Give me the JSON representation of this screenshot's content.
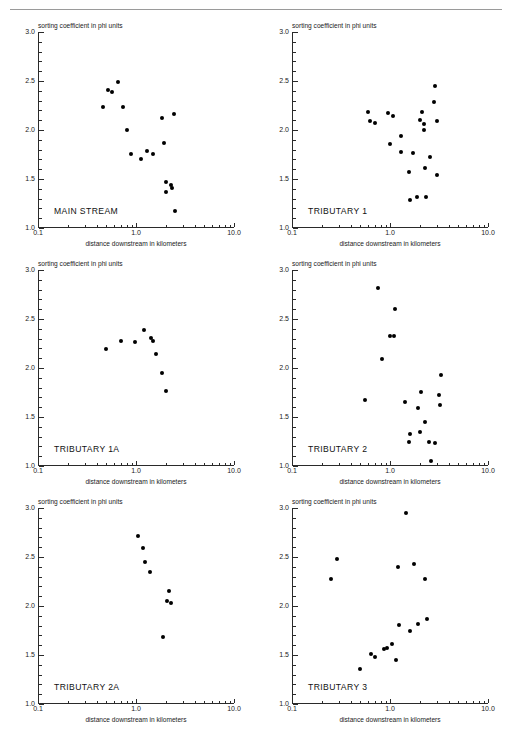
{
  "page": {
    "header_text": "",
    "has_top_rule": true
  },
  "axes": {
    "ylabel": "sorting coefficient in phi units",
    "xlabel": "distance downstream in kilometers",
    "ytick_labels": [
      "3.0",
      "2.5",
      "2.0",
      "1.5",
      "1.0"
    ],
    "ytick_values": [
      3.0,
      2.5,
      2.0,
      1.5,
      1.0
    ],
    "xtick_labels": [
      "0.1",
      "1.0",
      "10.0"
    ],
    "xtick_values": [
      0.1,
      1.0,
      10.0
    ],
    "ylim": [
      1.0,
      3.0
    ],
    "xlim": [
      0.1,
      10.0
    ],
    "xscale": "log",
    "marker_color": "#000000",
    "axis_color": "#2a2a2a"
  },
  "chart_data": [
    {
      "type": "scatter",
      "title": "MAIN STREAM",
      "xlabel": "distance downstream in kilometers",
      "ylabel": "sorting coefficient in phi units",
      "xscale": "log",
      "xlim": [
        0.1,
        10.0
      ],
      "ylim": [
        1.0,
        3.0
      ],
      "grid": false,
      "legend": "none",
      "points": [
        {
          "x": 0.46,
          "y": 2.23
        },
        {
          "x": 0.52,
          "y": 2.41
        },
        {
          "x": 0.57,
          "y": 2.39
        },
        {
          "x": 0.65,
          "y": 2.49
        },
        {
          "x": 0.74,
          "y": 2.23
        },
        {
          "x": 0.8,
          "y": 2.0
        },
        {
          "x": 0.89,
          "y": 1.76
        },
        {
          "x": 1.13,
          "y": 1.7
        },
        {
          "x": 1.3,
          "y": 1.79
        },
        {
          "x": 1.5,
          "y": 1.76
        },
        {
          "x": 1.85,
          "y": 2.12
        },
        {
          "x": 1.95,
          "y": 1.87
        },
        {
          "x": 2.0,
          "y": 1.47
        },
        {
          "x": 2.0,
          "y": 1.37
        },
        {
          "x": 2.25,
          "y": 1.44
        },
        {
          "x": 2.32,
          "y": 1.41
        },
        {
          "x": 2.45,
          "y": 2.16
        },
        {
          "x": 2.5,
          "y": 1.17
        }
      ]
    },
    {
      "type": "scatter",
      "title": "TRIBUTARY 1",
      "xlabel": "distance downstream in kilometers",
      "ylabel": "sorting coefficient in phi units",
      "xscale": "log",
      "xlim": [
        0.1,
        10.0
      ],
      "ylim": [
        1.0,
        3.0
      ],
      "grid": false,
      "legend": "none",
      "points": [
        {
          "x": 0.6,
          "y": 2.18
        },
        {
          "x": 0.63,
          "y": 2.09
        },
        {
          "x": 0.7,
          "y": 2.07
        },
        {
          "x": 0.96,
          "y": 2.17
        },
        {
          "x": 1.0,
          "y": 1.86
        },
        {
          "x": 1.07,
          "y": 2.14
        },
        {
          "x": 1.3,
          "y": 1.94
        },
        {
          "x": 1.3,
          "y": 1.78
        },
        {
          "x": 1.55,
          "y": 1.57
        },
        {
          "x": 1.6,
          "y": 1.29
        },
        {
          "x": 1.7,
          "y": 1.77
        },
        {
          "x": 1.9,
          "y": 1.32
        },
        {
          "x": 2.0,
          "y": 2.1
        },
        {
          "x": 2.1,
          "y": 2.18
        },
        {
          "x": 2.2,
          "y": 2.06
        },
        {
          "x": 2.22,
          "y": 2.0
        },
        {
          "x": 2.3,
          "y": 1.61
        },
        {
          "x": 2.35,
          "y": 1.32
        },
        {
          "x": 2.55,
          "y": 1.72
        },
        {
          "x": 2.8,
          "y": 2.29
        },
        {
          "x": 2.9,
          "y": 2.45
        },
        {
          "x": 3.0,
          "y": 2.09
        },
        {
          "x": 3.05,
          "y": 1.54
        }
      ]
    },
    {
      "type": "scatter",
      "title": "TRIBUTARY 1A",
      "xlabel": "distance downstream in kilometers",
      "ylabel": "sorting coefficient in phi units",
      "xscale": "log",
      "xlim": [
        0.1,
        10.0
      ],
      "ylim": [
        1.0,
        3.0
      ],
      "grid": false,
      "legend": "none",
      "points": [
        {
          "x": 0.49,
          "y": 2.19
        },
        {
          "x": 0.7,
          "y": 2.28
        },
        {
          "x": 0.97,
          "y": 2.27
        },
        {
          "x": 1.2,
          "y": 2.39
        },
        {
          "x": 1.43,
          "y": 2.31
        },
        {
          "x": 1.5,
          "y": 2.28
        },
        {
          "x": 1.6,
          "y": 2.14
        },
        {
          "x": 1.85,
          "y": 1.95
        },
        {
          "x": 2.0,
          "y": 1.77
        }
      ]
    },
    {
      "type": "scatter",
      "title": "TRIBUTARY 2",
      "xlabel": "distance downstream in kilometers",
      "ylabel": "sorting coefficient in phi units",
      "xscale": "log",
      "xlim": [
        0.1,
        10.0
      ],
      "ylim": [
        1.0,
        3.0
      ],
      "grid": false,
      "legend": "none",
      "points": [
        {
          "x": 0.56,
          "y": 1.67
        },
        {
          "x": 0.76,
          "y": 2.82
        },
        {
          "x": 0.82,
          "y": 2.09
        },
        {
          "x": 1.0,
          "y": 2.33
        },
        {
          "x": 1.1,
          "y": 2.33
        },
        {
          "x": 1.12,
          "y": 2.6
        },
        {
          "x": 1.42,
          "y": 1.65
        },
        {
          "x": 1.55,
          "y": 1.25
        },
        {
          "x": 1.6,
          "y": 1.33
        },
        {
          "x": 1.95,
          "y": 1.59
        },
        {
          "x": 2.0,
          "y": 1.35
        },
        {
          "x": 2.05,
          "y": 1.76
        },
        {
          "x": 2.25,
          "y": 1.45
        },
        {
          "x": 2.5,
          "y": 1.25
        },
        {
          "x": 2.6,
          "y": 1.05
        },
        {
          "x": 2.85,
          "y": 1.23
        },
        {
          "x": 3.15,
          "y": 1.72
        },
        {
          "x": 3.2,
          "y": 1.62
        },
        {
          "x": 3.35,
          "y": 1.93
        }
      ]
    },
    {
      "type": "scatter",
      "title": "TRIBUTARY 2A",
      "xlabel": "distance downstream in kilometers",
      "ylabel": "sorting coefficient in phi units",
      "xscale": "log",
      "xlim": [
        0.1,
        10.0
      ],
      "ylim": [
        1.0,
        3.0
      ],
      "grid": false,
      "legend": "none",
      "points": [
        {
          "x": 1.05,
          "y": 2.71
        },
        {
          "x": 1.18,
          "y": 2.59
        },
        {
          "x": 1.25,
          "y": 2.45
        },
        {
          "x": 1.4,
          "y": 2.35
        },
        {
          "x": 1.9,
          "y": 1.68
        },
        {
          "x": 2.05,
          "y": 2.05
        },
        {
          "x": 2.15,
          "y": 2.15
        },
        {
          "x": 2.25,
          "y": 2.03
        }
      ]
    },
    {
      "type": "scatter",
      "title": "TRIBUTARY 3",
      "xlabel": "distance downstream in kilometers",
      "ylabel": "sorting coefficient in phi units",
      "xscale": "log",
      "xlim": [
        0.1,
        10.0
      ],
      "ylim": [
        1.0,
        3.0
      ],
      "grid": false,
      "legend": "none",
      "points": [
        {
          "x": 0.25,
          "y": 2.28
        },
        {
          "x": 0.29,
          "y": 2.48
        },
        {
          "x": 0.5,
          "y": 1.36
        },
        {
          "x": 0.64,
          "y": 1.51
        },
        {
          "x": 0.7,
          "y": 1.48
        },
        {
          "x": 0.86,
          "y": 1.56
        },
        {
          "x": 0.94,
          "y": 1.57
        },
        {
          "x": 1.05,
          "y": 1.61
        },
        {
          "x": 1.15,
          "y": 1.45
        },
        {
          "x": 1.2,
          "y": 2.4
        },
        {
          "x": 1.25,
          "y": 1.81
        },
        {
          "x": 1.45,
          "y": 2.95
        },
        {
          "x": 1.6,
          "y": 1.74
        },
        {
          "x": 1.75,
          "y": 2.43
        },
        {
          "x": 1.95,
          "y": 1.82
        },
        {
          "x": 2.3,
          "y": 2.28
        },
        {
          "x": 2.4,
          "y": 1.87
        }
      ]
    }
  ]
}
